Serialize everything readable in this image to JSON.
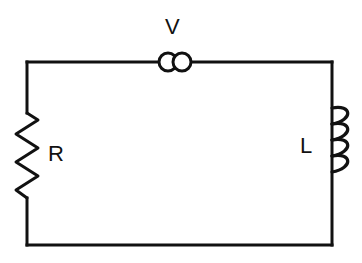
{
  "diagram": {
    "type": "circuit-schematic",
    "background_color": "#ffffff",
    "line_color": "#111111",
    "line_width": 3,
    "width": 362,
    "height": 263
  },
  "loop": {
    "left_x": 27,
    "right_x": 332,
    "top_y": 62,
    "bottom_y": 245
  },
  "components": {
    "source": {
      "label": "V",
      "name": "voltage-source",
      "symbol": "two-overlapping-circles",
      "center_x": 175,
      "center_y": 62,
      "circle_radius": 9,
      "circle_offset": 7,
      "label_x": 175,
      "label_y": 28
    },
    "resistor": {
      "label": "R",
      "name": "resistor",
      "symbol": "vertical-zigzag",
      "x": 27,
      "top_y": 113,
      "bottom_y": 198,
      "amplitude": 11,
      "peaks": 6,
      "label_x": 55,
      "label_y": 155
    },
    "inductor": {
      "label": "L",
      "name": "inductor",
      "symbol": "four-coil-loops",
      "x": 332,
      "top_y": 108,
      "bottom_y": 172,
      "loops": 4,
      "loop_width": 20,
      "loop_height": 16,
      "label_x": 306,
      "label_y": 147
    }
  },
  "labels": {
    "source": "V",
    "resistor": "R",
    "inductor": "L"
  }
}
